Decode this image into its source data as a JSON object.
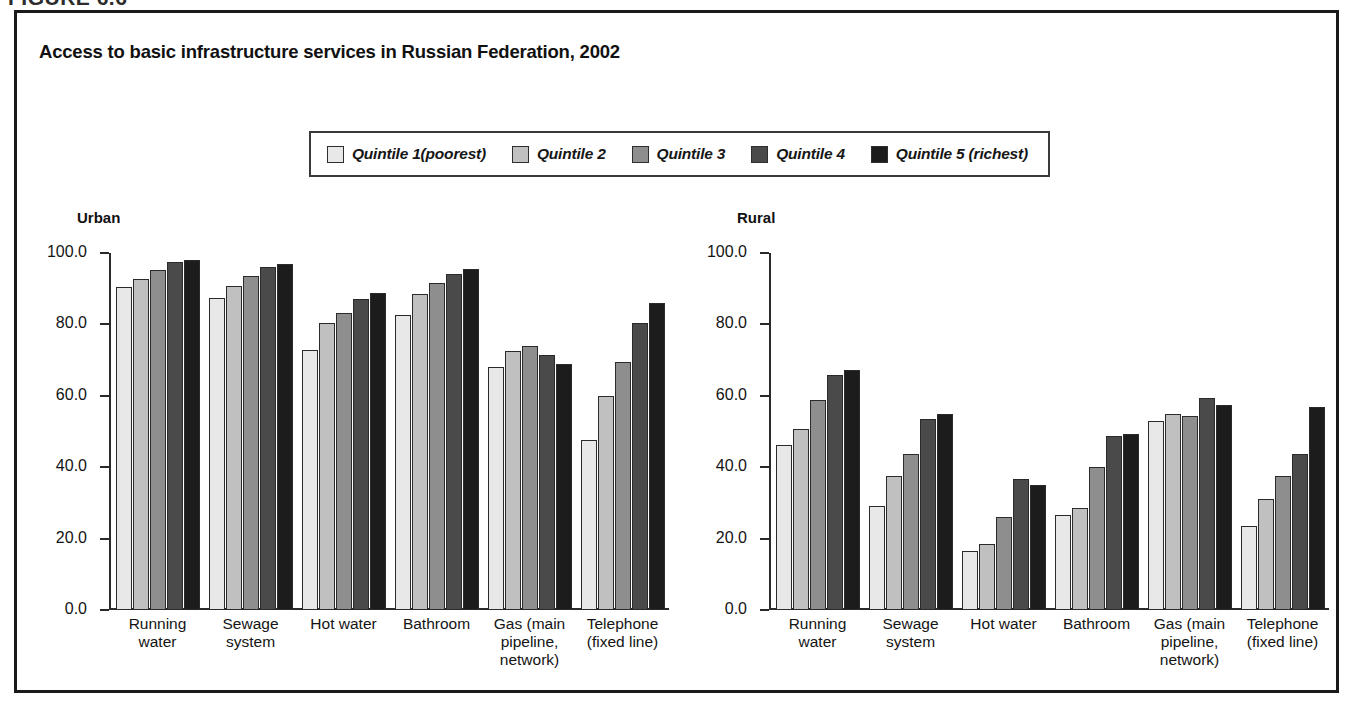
{
  "figure_tag": "FIGURE 6.6",
  "chart_title": "Access to basic infrastructure services in Russian Federation, 2002",
  "legend": {
    "items": [
      {
        "label": "Quintile 1(poorest)",
        "color": "#e8e8e8"
      },
      {
        "label": "Quintile 2",
        "color": "#c0c0c0"
      },
      {
        "label": "Quintile 3",
        "color": "#8e8e8e"
      },
      {
        "label": "Quintile 4",
        "color": "#4a4a4a"
      },
      {
        "label": "Quintile 5 (richest)",
        "color": "#1c1c1c"
      }
    ]
  },
  "panels": [
    {
      "title": "Urban"
    },
    {
      "title": "Rural"
    }
  ],
  "axis": {
    "ticks": [
      "100.0",
      "80.0",
      "60.0",
      "40.0",
      "20.0",
      "0.0"
    ]
  },
  "chart_data": [
    {
      "type": "bar",
      "title": "Access to basic infrastructure services in Russian Federation, 2002",
      "subtitle": "Urban",
      "xlabel": "",
      "ylabel": "",
      "ylim": [
        0,
        100
      ],
      "yticks": [
        0,
        20,
        40,
        60,
        80,
        100
      ],
      "grid": false,
      "legend_position": "top-center",
      "categories": [
        "Running water",
        "Sewage system",
        "Hot water",
        "Bathroom",
        "Gas (main pipeline, network)",
        "Telephone (fixed line)"
      ],
      "series": [
        {
          "name": "Quintile 1(poorest)",
          "values": [
            90.5,
            87.5,
            72.8,
            82.7,
            68.0,
            47.6
          ]
        },
        {
          "name": "Quintile 2",
          "values": [
            92.7,
            90.8,
            80.4,
            88.4,
            72.5,
            60.0
          ]
        },
        {
          "name": "Quintile 3",
          "values": [
            95.3,
            93.7,
            83.3,
            91.7,
            74.0,
            69.4
          ]
        },
        {
          "name": "Quintile 4",
          "values": [
            97.5,
            96.1,
            87.1,
            94.1,
            71.5,
            80.4
          ]
        },
        {
          "name": "Quintile 5 (richest)",
          "values": [
            98.0,
            96.9,
            88.8,
            95.6,
            69.0,
            86.0
          ]
        }
      ]
    },
    {
      "type": "bar",
      "title": "Access to basic infrastructure services in Russian Federation, 2002",
      "subtitle": "Rural",
      "xlabel": "",
      "ylabel": "",
      "ylim": [
        0,
        100
      ],
      "yticks": [
        0,
        20,
        40,
        60,
        80,
        100
      ],
      "grid": false,
      "legend_position": "top-center",
      "categories": [
        "Running water",
        "Sewage system",
        "Hot water",
        "Bathroom",
        "Gas (main pipeline, network)",
        "Telephone (fixed line)"
      ],
      "series": [
        {
          "name": "Quintile 1(poorest)",
          "values": [
            46.2,
            29.2,
            16.4,
            26.6,
            53.0,
            23.4
          ]
        },
        {
          "name": "Quintile 2",
          "values": [
            50.8,
            37.6,
            18.6,
            28.6,
            55.0,
            31.0
          ]
        },
        {
          "name": "Quintile 3",
          "values": [
            58.8,
            43.6,
            26.0,
            40.2,
            54.4,
            37.4
          ]
        },
        {
          "name": "Quintile 4",
          "values": [
            65.8,
            53.4,
            36.8,
            48.8,
            59.4,
            43.8
          ]
        },
        {
          "name": "Quintile 5 (richest)",
          "values": [
            67.1,
            54.9,
            35.0,
            49.4,
            57.4,
            56.8
          ]
        }
      ]
    }
  ]
}
